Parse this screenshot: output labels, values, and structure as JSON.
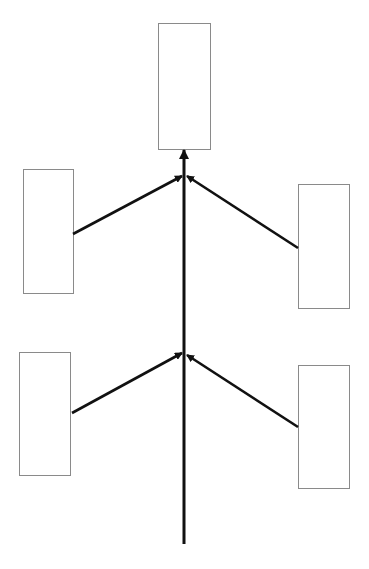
{
  "diagram": {
    "type": "blank fishbone / convergence diagram",
    "colors": {
      "background": "#ffffff",
      "box_border": "#8a8a8a",
      "arrow": "#111111"
    },
    "boxes": [
      {
        "id": "top-box",
        "label": "",
        "x": 158,
        "y": 23,
        "w": 52,
        "h": 126
      },
      {
        "id": "upper-left-box",
        "label": "",
        "x": 23,
        "y": 169,
        "w": 50,
        "h": 124
      },
      {
        "id": "upper-right-box",
        "label": "",
        "x": 298,
        "y": 184,
        "w": 51,
        "h": 124
      },
      {
        "id": "lower-left-box",
        "label": "",
        "x": 19,
        "y": 352,
        "w": 51,
        "h": 123
      },
      {
        "id": "lower-right-box",
        "label": "",
        "x": 298,
        "y": 365,
        "w": 51,
        "h": 123
      }
    ],
    "spine": {
      "x": 184,
      "y_start": 544,
      "y_end": 150
    },
    "branches": [
      {
        "id": "upper-left-arrow",
        "from": [
          73,
          234
        ],
        "to": [
          182,
          176
        ]
      },
      {
        "id": "upper-right-arrow",
        "from": [
          298,
          248
        ],
        "to": [
          187,
          176
        ]
      },
      {
        "id": "lower-left-arrow",
        "from": [
          72,
          413
        ],
        "to": [
          182,
          353
        ]
      },
      {
        "id": "lower-right-arrow",
        "from": [
          298,
          427
        ],
        "to": [
          187,
          355
        ]
      }
    ]
  }
}
